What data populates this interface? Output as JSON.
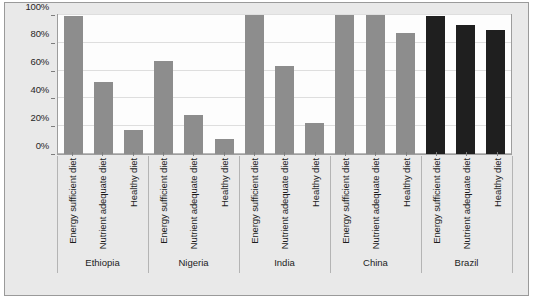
{
  "chart_data": {
    "type": "bar",
    "title": "",
    "subtitle": "",
    "xlabel": "",
    "ylabel": "",
    "ylim": [
      0,
      100
    ],
    "y_tick_labels": [
      "0%",
      "20%",
      "40%",
      "60%",
      "80%",
      "100%"
    ],
    "y_ticks": [
      0,
      20,
      40,
      60,
      80,
      100
    ],
    "grid": true,
    "legend": "none",
    "legend_entries": [],
    "categories": [
      "Energy sufficient diet",
      "Nutrient adequate diet",
      "Healthy diet"
    ],
    "groups": [
      "Ethiopia",
      "Nigeria",
      "India",
      "China",
      "Brazil"
    ],
    "series": [
      {
        "name": "Ethiopia",
        "color": "#8d8d8d",
        "values": [
          99,
          52,
          17
        ]
      },
      {
        "name": "Nigeria",
        "color": "#8d8d8d",
        "values": [
          67,
          28,
          11
        ]
      },
      {
        "name": "India",
        "color": "#8d8d8d",
        "values": [
          100,
          63,
          22
        ]
      },
      {
        "name": "China",
        "color": "#8d8d8d",
        "values": [
          100,
          100,
          87
        ]
      },
      {
        "name": "Brazil",
        "color": "#1f1f1f",
        "values": [
          99,
          93,
          89
        ]
      }
    ],
    "colors": {
      "bar_default": "#8d8d8d",
      "bar_highlight": "#1f1f1f",
      "plot_background": "#fdfdfd",
      "frame_background": "#e9e9e9",
      "gridline": "#dedede",
      "axis": "#9d9d9d",
      "text": "#1c1c1c"
    }
  }
}
